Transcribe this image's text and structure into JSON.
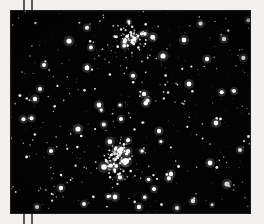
{
  "image": {
    "kind": "astronomical-photograph",
    "subject": "open star cluster field",
    "alt_text": "Black-and-white astronomical photograph showing a dense field of white stars against a black sky, with two concentrated star cluster cores.",
    "background_color": "#f2f1ef",
    "sky_color": "#030303",
    "star_color": "#ffffff",
    "plate": {
      "x": 11,
      "y": 11,
      "width": 239,
      "height": 202
    }
  },
  "marks": {
    "crop_ticks": [
      {
        "name": "tick-top-a",
        "x": 23,
        "y": 0,
        "length": 12,
        "color": "#5a5a5a"
      },
      {
        "name": "tick-top-b",
        "x": 31,
        "y": 0,
        "length": 12,
        "color": "#5a5a5a"
      },
      {
        "name": "tick-bottom-a",
        "x": 23,
        "y": 212,
        "length": 12,
        "color": "#5a5a5a"
      },
      {
        "name": "tick-bottom-b",
        "x": 31,
        "y": 212,
        "length": 12,
        "color": "#5a5a5a"
      }
    ]
  },
  "chart_data": {
    "type": "scatter",
    "title": "",
    "xlabel": "",
    "ylabel": "",
    "xlim": [
      0,
      239
    ],
    "ylim": [
      0,
      202
    ],
    "grid": false,
    "legend": null,
    "background": "#030303",
    "point_color": "#ffffff",
    "clusters": [
      {
        "name": "upper-cluster-core",
        "cx": 120,
        "cy": 27,
        "radius": 22,
        "star_count": 70
      },
      {
        "name": "lower-cluster-core",
        "cx": 105,
        "cy": 146,
        "radius": 24,
        "star_count": 80
      }
    ],
    "bright_stars": [
      [
        58,
        30,
        2.6
      ],
      [
        173,
        29,
        2.4
      ],
      [
        213,
        28,
        2.2
      ],
      [
        33,
        54,
        2.0
      ],
      [
        76,
        57,
        2.4
      ],
      [
        152,
        45,
        2.6
      ],
      [
        196,
        48,
        2.2
      ],
      [
        29,
        78,
        2.0
      ],
      [
        24,
        88,
        2.2
      ],
      [
        88,
        94,
        2.4
      ],
      [
        133,
        83,
        2.2
      ],
      [
        178,
        73,
        2.4
      ],
      [
        223,
        80,
        2.0
      ],
      [
        67,
        118,
        2.6
      ],
      [
        110,
        108,
        2.0
      ],
      [
        148,
        120,
        2.2
      ],
      [
        205,
        112,
        2.4
      ],
      [
        40,
        140,
        2.0
      ],
      [
        93,
        156,
        2.8
      ],
      [
        115,
        150,
        3.0
      ],
      [
        160,
        163,
        2.2
      ],
      [
        199,
        152,
        2.4
      ],
      [
        229,
        139,
        2.0
      ],
      [
        50,
        177,
        2.2
      ],
      [
        104,
        186,
        2.4
      ],
      [
        143,
        178,
        2.0
      ],
      [
        182,
        190,
        2.2
      ],
      [
        216,
        173,
        2.6
      ],
      [
        26,
        196,
        2.0
      ],
      [
        73,
        193,
        2.0
      ],
      [
        128,
        196,
        2.2
      ],
      [
        166,
        197,
        2.0
      ]
    ],
    "field_star_count": 430
  }
}
